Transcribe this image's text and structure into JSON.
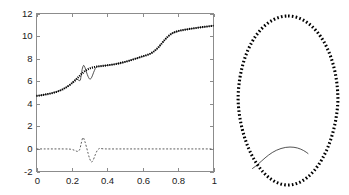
{
  "figure": {
    "title": "",
    "background_color": "#ffffff",
    "axis_color": "#8c8c8c",
    "series_color": "#000000"
  },
  "chart_data": [
    {
      "id": "left-plot",
      "type": "line",
      "title": "",
      "xlabel": "",
      "ylabel": "",
      "xlim": [
        0,
        1
      ],
      "ylim": [
        -2,
        12
      ],
      "grid": false,
      "legend": null,
      "xticks": [
        0,
        0.2,
        0.4,
        0.6,
        0.8,
        1
      ],
      "xticklabels": [
        "0",
        "0.2",
        "0.4",
        "0.6",
        "0.8",
        "1"
      ],
      "yticks": [
        -2,
        0,
        2,
        4,
        6,
        8,
        10,
        12
      ],
      "yticklabels": [
        "-2",
        "0",
        "2",
        "4",
        "6",
        "8",
        "10",
        "12"
      ],
      "series": [
        {
          "name": "reference-solution",
          "style": "dotted-thick",
          "marker": "dot",
          "x": [
            0.0,
            0.02,
            0.04,
            0.06,
            0.08,
            0.1,
            0.12,
            0.14,
            0.16,
            0.18,
            0.2,
            0.22,
            0.24,
            0.26,
            0.28,
            0.3,
            0.32,
            0.34,
            0.36,
            0.38,
            0.4,
            0.42,
            0.44,
            0.46,
            0.48,
            0.5,
            0.52,
            0.54,
            0.56,
            0.58,
            0.6,
            0.62,
            0.64,
            0.66,
            0.68,
            0.7,
            0.72,
            0.74,
            0.76,
            0.78,
            0.8,
            0.82,
            0.84,
            0.86,
            0.88,
            0.9,
            0.92,
            0.94,
            0.96,
            0.98,
            1.0
          ],
          "y": [
            4.7,
            4.74,
            4.79,
            4.85,
            4.92,
            5.0,
            5.1,
            5.22,
            5.38,
            5.58,
            5.82,
            6.1,
            6.42,
            6.72,
            6.97,
            7.13,
            7.23,
            7.29,
            7.33,
            7.37,
            7.41,
            7.45,
            7.5,
            7.56,
            7.63,
            7.71,
            7.8,
            7.9,
            8.0,
            8.1,
            8.2,
            8.3,
            8.42,
            8.6,
            8.86,
            9.2,
            9.58,
            9.92,
            10.18,
            10.34,
            10.44,
            10.51,
            10.57,
            10.62,
            10.67,
            10.71,
            10.76,
            10.8,
            10.84,
            10.88,
            10.92
          ]
        },
        {
          "name": "numerical-solution-oscillating",
          "style": "thin-solid",
          "description": "overlays reference solution with zigzag overshoot near x = 0.25 to 0.34",
          "x": [
            0.0,
            0.04,
            0.08,
            0.12,
            0.16,
            0.2,
            0.225,
            0.245,
            0.252,
            0.258,
            0.266,
            0.274,
            0.282,
            0.292,
            0.302,
            0.312,
            0.322,
            0.332,
            0.342,
            0.36,
            0.4,
            0.44,
            0.48,
            0.52,
            0.56,
            0.6,
            0.64,
            0.68,
            0.72,
            0.76,
            0.8,
            0.84,
            0.88,
            0.92,
            0.96,
            1.0
          ],
          "y": [
            4.7,
            4.79,
            4.92,
            5.1,
            5.38,
            5.82,
            6.18,
            6.05,
            6.45,
            7.05,
            7.4,
            7.2,
            6.82,
            6.4,
            6.18,
            6.35,
            6.75,
            7.12,
            7.3,
            7.33,
            7.41,
            7.5,
            7.63,
            7.8,
            8.0,
            8.2,
            8.42,
            8.86,
            9.58,
            10.18,
            10.44,
            10.57,
            10.67,
            10.76,
            10.84,
            10.92
          ]
        },
        {
          "name": "residual-error",
          "style": "dashed",
          "description": "error curve oscillating about zero with spike near x = 0.26 and dip near x = 0.31",
          "x": [
            0.0,
            0.05,
            0.1,
            0.15,
            0.19,
            0.215,
            0.232,
            0.244,
            0.252,
            0.262,
            0.272,
            0.282,
            0.292,
            0.3,
            0.31,
            0.32,
            0.332,
            0.344,
            0.356,
            0.37,
            0.4,
            0.5,
            0.6,
            0.7,
            0.8,
            0.9,
            1.0
          ],
          "y": [
            0.0,
            0.0,
            0.0,
            0.0,
            -0.02,
            -0.12,
            -0.22,
            -0.05,
            0.45,
            1.0,
            0.72,
            0.18,
            -0.42,
            -0.85,
            -1.15,
            -1.0,
            -0.52,
            -0.12,
            0.04,
            0.02,
            0.0,
            0.0,
            0.0,
            0.0,
            0.0,
            0.0,
            0.0
          ]
        }
      ]
    },
    {
      "id": "right-plot",
      "type": "scatter",
      "title": "",
      "xlabel": "",
      "ylabel": "",
      "axes_visible": false,
      "xticks": [],
      "yticks": [],
      "grid": false,
      "legend": null,
      "series": [
        {
          "name": "closed-oval-contour",
          "style": "dotted-thick",
          "marker": "dot",
          "shape": "ellipse",
          "center": [
            0.5,
            0.5
          ],
          "radius_x": 0.48,
          "radius_y": 0.5,
          "point_count": 72
        },
        {
          "name": "chord-arc",
          "style": "thin-solid",
          "description": "thin arc bulging upward across the lower-right portion of the oval"
        }
      ]
    }
  ]
}
